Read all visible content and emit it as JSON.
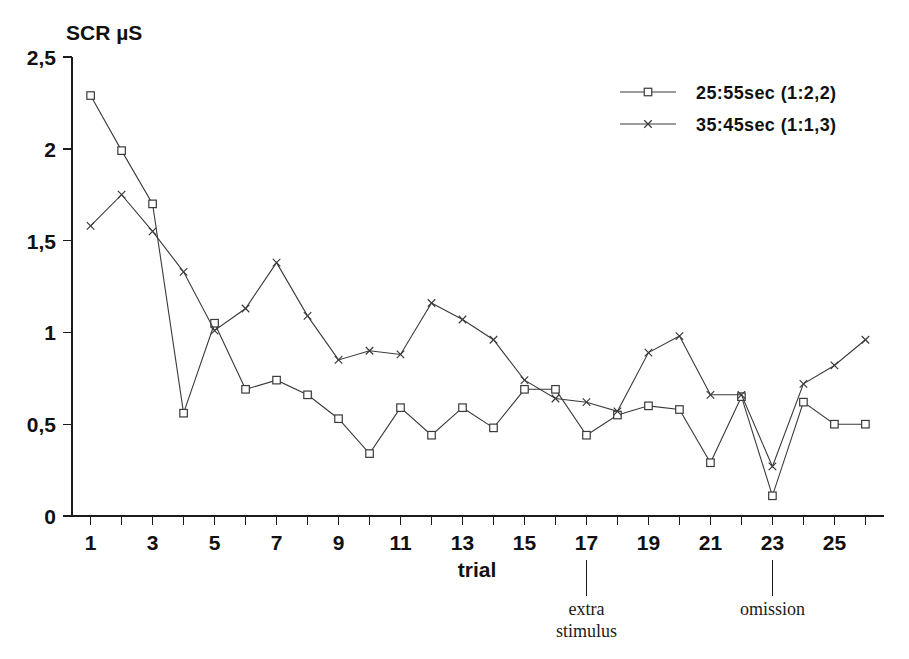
{
  "chart_data": {
    "type": "line",
    "title": "",
    "xlabel": "trial",
    "ylabel": "SCR µS",
    "ylim": [
      0,
      2.5
    ],
    "xlim": [
      0.4,
      26.6
    ],
    "grid": false,
    "legend_position": "top-right",
    "y_ticks": [
      "0",
      "0,5",
      "1",
      "1,5",
      "2",
      "2,5"
    ],
    "y_tick_values": [
      0,
      0.5,
      1,
      1.5,
      2,
      2.5
    ],
    "x_ticks": [
      "1",
      "3",
      "5",
      "7",
      "9",
      "11",
      "13",
      "15",
      "17",
      "19",
      "21",
      "23",
      "25"
    ],
    "x_tick_values": [
      1,
      3,
      5,
      7,
      9,
      11,
      13,
      15,
      17,
      19,
      21,
      23,
      25
    ],
    "x": [
      1,
      2,
      3,
      4,
      5,
      6,
      7,
      8,
      9,
      10,
      11,
      12,
      13,
      14,
      15,
      16,
      17,
      18,
      19,
      20,
      21,
      22,
      23,
      24,
      25,
      26
    ],
    "series": [
      {
        "name": "25:55sec (1:2,2)",
        "marker": "square",
        "values": [
          2.29,
          1.99,
          1.7,
          0.56,
          1.05,
          0.69,
          0.74,
          0.66,
          0.53,
          0.34,
          0.59,
          0.44,
          0.59,
          0.48,
          0.69,
          0.69,
          0.44,
          0.55,
          0.6,
          0.58,
          0.29,
          0.65,
          0.11,
          0.62,
          0.5,
          0.5
        ]
      },
      {
        "name": "35:45sec (1:1,3)",
        "marker": "x",
        "values": [
          1.58,
          1.75,
          1.55,
          1.33,
          1.01,
          1.13,
          1.38,
          1.09,
          0.85,
          0.9,
          0.88,
          1.16,
          1.07,
          0.96,
          0.74,
          0.64,
          0.62,
          0.57,
          0.89,
          0.98,
          0.66,
          0.66,
          0.27,
          0.72,
          0.82,
          0.96
        ]
      }
    ],
    "annotations": [
      {
        "label": "extra",
        "label2": "stimulus",
        "x": 17
      },
      {
        "label": "omission",
        "label2": "",
        "x": 23
      }
    ]
  },
  "legend": {
    "items": [
      {
        "label": "25:55sec (1:2,2)",
        "marker": "square"
      },
      {
        "label": "35:45sec (1:1,3)",
        "marker": "x"
      }
    ]
  }
}
